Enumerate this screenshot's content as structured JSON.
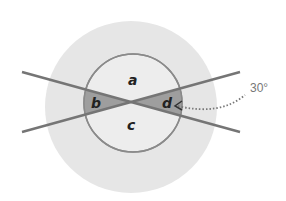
{
  "diagram": {
    "regions": {
      "a": "a",
      "b": "b",
      "c": "c",
      "d": "d"
    },
    "angle_label": "30°",
    "colors": {
      "outer_circle": "#e6e6e6",
      "inner_circle": "#ededed",
      "inner_stroke": "#8a8a8a",
      "shaded_sector": "#9e9e9e",
      "lines": "#757575",
      "arrow": "#777777"
    }
  }
}
